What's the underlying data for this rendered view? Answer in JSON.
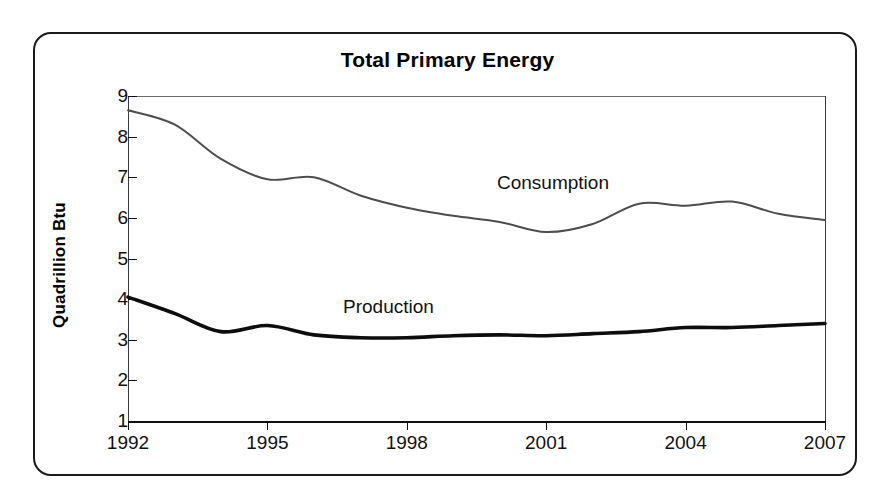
{
  "chart_data": {
    "type": "line",
    "title": "Total Primary Energy",
    "xlabel": "",
    "ylabel": "Quadrillion Btu",
    "xlim": [
      1992,
      2007
    ],
    "ylim": [
      1,
      9
    ],
    "grid": false,
    "legend_position": "inline-labels",
    "xticks": [
      "1992",
      "1995",
      "1998",
      "2001",
      "2004",
      "2007"
    ],
    "xtick_values": [
      1992,
      1995,
      1998,
      2001,
      2004,
      2007
    ],
    "yticks": [
      "1",
      "2",
      "3",
      "4",
      "5",
      "6",
      "7",
      "8",
      "9"
    ],
    "ytick_values": [
      1,
      2,
      3,
      4,
      5,
      6,
      7,
      8,
      9
    ],
    "x": [
      1992,
      1993,
      1994,
      1995,
      1996,
      1997,
      1998,
      1999,
      2000,
      2001,
      2002,
      2003,
      2004,
      2005,
      2006,
      2007
    ],
    "series": [
      {
        "name": "Consumption",
        "color": "#4d4d4d",
        "line_width": 2.0,
        "values": [
          8.65,
          8.3,
          7.45,
          6.95,
          7.0,
          6.55,
          6.25,
          6.05,
          5.9,
          5.65,
          5.85,
          6.35,
          6.3,
          6.4,
          6.1,
          5.95
        ]
      },
      {
        "name": "Production",
        "color": "#0d0d0d",
        "line_width": 3.6,
        "values": [
          4.05,
          3.65,
          3.2,
          3.35,
          3.12,
          3.05,
          3.05,
          3.1,
          3.12,
          3.1,
          3.15,
          3.2,
          3.3,
          3.3,
          3.35,
          3.4
        ]
      }
    ],
    "annotations": [
      {
        "text": "Consumption",
        "x": 1999.5,
        "y": 7.1
      },
      {
        "text": "Production",
        "x": 1996.3,
        "y": 4.05
      }
    ]
  },
  "frame": {
    "border_color": "#1a1a1a",
    "background": "#ffffff"
  },
  "icons": {
    "consumption_line": "thin-gray-line-icon",
    "production_line": "thick-black-line-icon"
  }
}
